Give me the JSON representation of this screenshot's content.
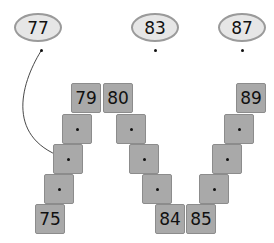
{
  "bubbles": [
    {
      "label": "77"
    },
    {
      "label": "83"
    },
    {
      "label": "87"
    }
  ],
  "tiles": [
    {
      "label": "75"
    },
    {
      "label": ""
    },
    {
      "label": ""
    },
    {
      "label": ""
    },
    {
      "label": "79"
    },
    {
      "label": "80"
    },
    {
      "label": ""
    },
    {
      "label": ""
    },
    {
      "label": ""
    },
    {
      "label": "84"
    },
    {
      "label": "85"
    },
    {
      "label": ""
    },
    {
      "label": ""
    },
    {
      "label": ""
    },
    {
      "label": "89"
    }
  ],
  "arrow": {
    "from": "77",
    "to_tile_index": 2
  }
}
